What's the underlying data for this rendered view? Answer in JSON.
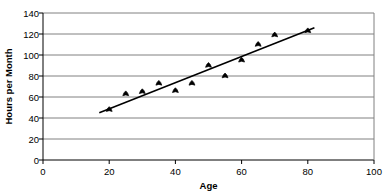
{
  "chart_data": {
    "type": "scatter",
    "title": "",
    "xlabel": "Age",
    "ylabel": "Hours per Month",
    "xlim": [
      0,
      100
    ],
    "ylim": [
      0,
      140
    ],
    "xticks": [
      0,
      20,
      40,
      60,
      80,
      100
    ],
    "yticks": [
      0,
      20,
      40,
      60,
      80,
      100,
      120,
      140
    ],
    "grid": "horizontal",
    "legend": "none",
    "x": [
      20,
      25,
      30,
      35,
      40,
      45,
      50,
      55,
      60,
      65,
      70,
      80
    ],
    "y": [
      48,
      63,
      65,
      73,
      66,
      73,
      90,
      80,
      95,
      110,
      119,
      123
    ],
    "points": [
      {
        "x": 20,
        "y": 48
      },
      {
        "x": 25,
        "y": 63
      },
      {
        "x": 30,
        "y": 65
      },
      {
        "x": 35,
        "y": 73
      },
      {
        "x": 40,
        "y": 66
      },
      {
        "x": 45,
        "y": 73
      },
      {
        "x": 50,
        "y": 90
      },
      {
        "x": 55,
        "y": 80
      },
      {
        "x": 60,
        "y": 95
      },
      {
        "x": 65,
        "y": 110
      },
      {
        "x": 70,
        "y": 119
      },
      {
        "x": 80,
        "y": 123
      }
    ],
    "trendline": {
      "type": "linear",
      "x_start": 17,
      "y_start": 45,
      "x_end": 82,
      "y_end": 126
    },
    "colors": {
      "marker": "#000000",
      "trendline": "#000000",
      "gridline": "#808080",
      "axis": "#000000",
      "background": "#ffffff"
    }
  },
  "labels": {
    "y_title": "Hours per Month",
    "x_title": "Age",
    "y_tick_labels": [
      "140",
      "120",
      "100",
      "80",
      "60",
      "40",
      "20",
      "0"
    ],
    "x_tick_labels": [
      "0",
      "20",
      "40",
      "60",
      "80",
      "100"
    ]
  }
}
